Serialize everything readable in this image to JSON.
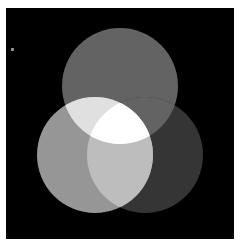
{
  "figure": {
    "title": "",
    "background_color": "#ffffff",
    "plot_background_color": "#000000",
    "plot_left": 6,
    "plot_top": 8,
    "plot_width": 228,
    "plot_height": 231,
    "marker_label": "",
    "marker_color": "#8d8d8d"
  },
  "chart_data": {
    "type": "venn",
    "title": "",
    "subtitle": "",
    "xlabel": "",
    "ylabel": "",
    "grid": false,
    "legend_position": "none",
    "background": "#000000",
    "canvas": {
      "width": 228,
      "height": 231
    },
    "sets": [
      {
        "name": "top",
        "label": "",
        "cx": 114,
        "cy": 78,
        "r": 58,
        "fill": "#636363",
        "opacity": 1
      },
      {
        "name": "left",
        "label": "",
        "cx": 89,
        "cy": 147,
        "r": 58,
        "fill": "#969696",
        "opacity": 1
      },
      {
        "name": "right",
        "label": "",
        "cx": 139,
        "cy": 147,
        "r": 58,
        "fill": "#353535",
        "opacity": 1
      }
    ],
    "regions": [
      {
        "id": "top",
        "members": [
          "top"
        ],
        "color": "#636363",
        "value": null,
        "label": ""
      },
      {
        "id": "left",
        "members": [
          "left"
        ],
        "color": "#969696",
        "value": null,
        "label": ""
      },
      {
        "id": "right",
        "members": [
          "right"
        ],
        "color": "#353535",
        "value": null,
        "label": ""
      },
      {
        "id": "top-left",
        "members": [
          "top",
          "left"
        ],
        "color": "#e0e0e0",
        "value": null,
        "label": ""
      },
      {
        "id": "top-right",
        "members": [
          "top",
          "right"
        ],
        "color": "#636363",
        "value": null,
        "label": ""
      },
      {
        "id": "left-right",
        "members": [
          "left",
          "right"
        ],
        "color": "#bdbdbd",
        "value": null,
        "label": ""
      },
      {
        "id": "top-left-right",
        "members": [
          "top",
          "left",
          "right"
        ],
        "color": "#ffffff",
        "value": null,
        "label": ""
      }
    ],
    "annotations": [
      {
        "id": "corner-dot",
        "x": 5,
        "y": 40,
        "w": 3,
        "h": 3,
        "color": "#8d8d8d",
        "text": ""
      }
    ]
  }
}
